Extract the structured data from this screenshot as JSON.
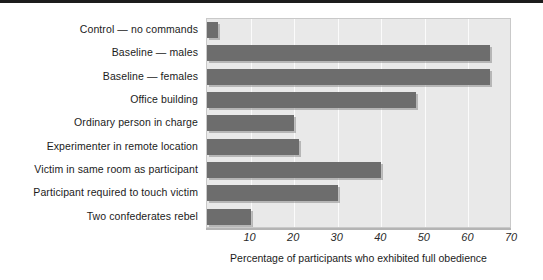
{
  "chart_data": {
    "type": "bar",
    "orientation": "horizontal",
    "title": "",
    "xlabel": "Percentage of participants who exhibited full obedience",
    "ylabel": "",
    "xlim": [
      0,
      70
    ],
    "xticks": [
      10,
      20,
      30,
      40,
      50,
      60,
      70
    ],
    "xtick_labels": [
      "10",
      "20",
      "30",
      "40",
      "50",
      "60",
      "70"
    ],
    "grid": true,
    "grid_axis": "x",
    "legend": "none",
    "categories": [
      "Control — no commands",
      "Baseline — males",
      "Baseline — females",
      "Office building",
      "Ordinary person in charge",
      "Experimenter in remote location",
      "Victim in same room as participant",
      "Participant required to touch victim",
      "Two confederates rebel"
    ],
    "values": [
      2.5,
      65,
      65,
      48,
      20,
      21,
      40,
      30,
      10
    ],
    "bar_color": "#6d6d6d",
    "plot_background": "#e9e9e9",
    "gridline_color": "#fbfbfb"
  }
}
